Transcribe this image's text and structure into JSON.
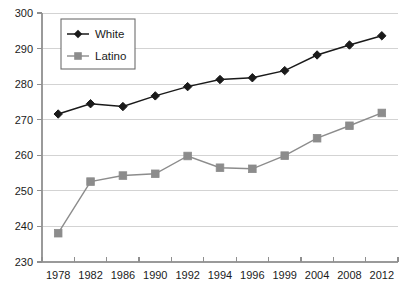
{
  "chart_data": {
    "type": "line",
    "title": "",
    "subtitle": "",
    "xlabel": "",
    "ylabel": "",
    "categories": [
      "1978",
      "1982",
      "1986",
      "1990",
      "1992",
      "1994",
      "1996",
      "1999",
      "2004",
      "2008",
      "2012"
    ],
    "ylim": [
      230,
      300
    ],
    "yticks": [
      230,
      240,
      250,
      260,
      270,
      280,
      290,
      300
    ],
    "grid": true,
    "legend_position": "top-left",
    "series": [
      {
        "name": "White",
        "color": "#1a1a1a",
        "marker": "diamond",
        "values": [
          271.6,
          274.5,
          273.7,
          276.7,
          279.3,
          281.3,
          281.8,
          283.8,
          288.2,
          291.0,
          293.6
        ]
      },
      {
        "name": "Latino",
        "color": "#8c8c8c",
        "marker": "square",
        "values": [
          238.1,
          252.6,
          254.3,
          254.8,
          259.8,
          256.5,
          256.2,
          259.9,
          264.8,
          268.3,
          271.9
        ]
      }
    ]
  },
  "legend": {
    "entries": [
      {
        "label": "White"
      },
      {
        "label": "Latino"
      }
    ]
  },
  "colors": {
    "white_series": "#1a1a1a",
    "latino_series": "#8c8c8c",
    "gridline": "#d3d3d3",
    "axis": "#9a9a9a",
    "text": "#1b1b1b",
    "background": "#ffffff"
  }
}
